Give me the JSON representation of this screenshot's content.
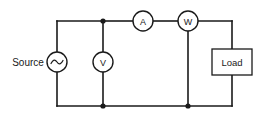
{
  "diagram": {
    "background_color": "#ffffff",
    "line_color": "#1a1a1a",
    "source": {
      "label": "Source",
      "symbol": "ac-source-icon",
      "symbol_char": "∿"
    },
    "meters": [
      {
        "id": "ammeter",
        "letter": "A",
        "name": "ammeter",
        "connection": "series"
      },
      {
        "id": "wattmeter",
        "letter": "W",
        "name": "wattmeter",
        "connection": "series-shunt"
      },
      {
        "id": "voltmeter",
        "letter": "V",
        "name": "voltmeter",
        "connection": "shunt"
      }
    ],
    "load": {
      "label": "Load"
    }
  }
}
